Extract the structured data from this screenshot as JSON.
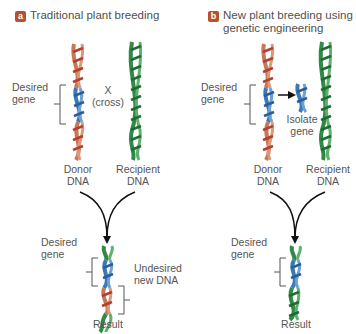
{
  "colors": {
    "badge": "#b5512c",
    "donor_strand": "#c87856",
    "donor_rung": "#b0402f",
    "gene_strand": "#3a78b8",
    "recipient_strand": "#2e8a44",
    "recipient_rung": "#1f6b33",
    "text": "#555555"
  },
  "panel_a": {
    "badge": "a",
    "title": "Traditional plant breeding",
    "desired_gene_label_1": "Desired",
    "desired_gene_label_2": "gene",
    "cross_label_1": "X",
    "cross_label_2": "(cross)",
    "donor_label_1": "Donor",
    "donor_label_2": "DNA",
    "recipient_label_1": "Recipient",
    "recipient_label_2": "DNA",
    "result_desired_1": "Desired",
    "result_desired_2": "gene",
    "undesired_1": "Undesired",
    "undesired_2": "new DNA",
    "result_label": "Result"
  },
  "panel_b": {
    "badge": "b",
    "title_line1": "New plant breeding using",
    "title_line2": "genetic engineering",
    "desired_gene_label_1": "Desired",
    "desired_gene_label_2": "gene",
    "isolate_label_1": "Isolate",
    "isolate_label_2": "gene",
    "donor_label_1": "Donor",
    "donor_label_2": "DNA",
    "recipient_label_1": "Recipient",
    "recipient_label_2": "DNA",
    "result_desired_1": "Desired",
    "result_desired_2": "gene",
    "result_label": "Result"
  }
}
